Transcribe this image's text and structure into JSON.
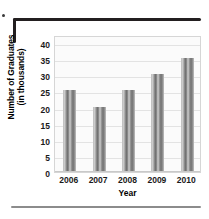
{
  "chart_data": {
    "type": "bar",
    "title": "",
    "xlabel": "Year",
    "ylabel_line1": "Number of Graduates",
    "ylabel_line2": "(in thousands)",
    "categories": [
      "2006",
      "2007",
      "2008",
      "2009",
      "2010"
    ],
    "values": [
      25,
      20,
      25,
      30,
      35
    ],
    "yticks": [
      "40",
      "35",
      "30",
      "25",
      "20",
      "15",
      "10",
      "5",
      "0"
    ],
    "ylim": [
      0,
      42.5
    ],
    "grid": true,
    "legend": "none",
    "series_name": "Number of Graduates"
  },
  "figure": {
    "bracket": "corner-bracket",
    "bottom_rule": "horizontal-divider"
  },
  "colors": {
    "bar_dark": "#6e6e6e",
    "bar_light": "#d9d9d9",
    "grid": "#e3e3e3",
    "plot_border": "#d6d6d6",
    "plot_background": "#fbfbfb",
    "text": "#000000",
    "bracket": "#231f20",
    "rule": "#8c8c8c"
  }
}
